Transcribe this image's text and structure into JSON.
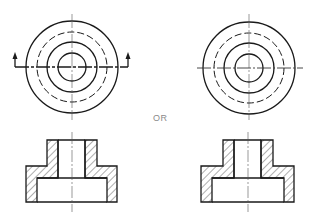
{
  "diagram": {
    "title": "",
    "separator_label": "OR",
    "colors": {
      "line": "#1a1a1a",
      "hatch": "#333333",
      "centerline": "#555555",
      "label": "#8a8a8a",
      "background": "#ffffff"
    },
    "views": [
      {
        "id": "left",
        "top_view": {
          "center": [
            72,
            67
          ],
          "circles": [
            {
              "r": 46,
              "style": "solid"
            },
            {
              "r": 35,
              "style": "dashed"
            },
            {
              "r": 25,
              "style": "solid"
            },
            {
              "r": 14,
              "style": "solid"
            }
          ],
          "cutting_plane": {
            "y": 67,
            "x_start": 15,
            "x_end": 128,
            "arrow_direction": "up"
          }
        },
        "section_view": {
          "center_x": 72,
          "boss": {
            "x_left": 47,
            "x_right": 97,
            "top": 140,
            "bottom": 166
          },
          "bore": {
            "x_left": 58,
            "x_right": 85
          },
          "flange": {
            "x_left": 26,
            "x_right": 117,
            "top": 166,
            "bottom": 202
          },
          "counterbore": {
            "x_left": 37,
            "x_right": 107,
            "top": 178,
            "bottom": 202
          }
        }
      },
      {
        "id": "right",
        "top_view": {
          "center": [
            249,
            68
          ],
          "circles": [
            {
              "r": 46,
              "style": "solid"
            },
            {
              "r": 35,
              "style": "dashed"
            },
            {
              "r": 25,
              "style": "solid"
            },
            {
              "r": 14,
              "style": "solid"
            }
          ],
          "cutting_plane": null
        },
        "section_view": {
          "center_x": 248,
          "boss": {
            "x_left": 223,
            "x_right": 273,
            "top": 140,
            "bottom": 166
          },
          "bore": {
            "x_left": 234,
            "x_right": 261
          },
          "flange": {
            "x_left": 201,
            "x_right": 294,
            "top": 166,
            "bottom": 202
          },
          "counterbore": {
            "x_left": 212,
            "x_right": 284,
            "top": 178,
            "bottom": 202
          }
        }
      }
    ]
  }
}
